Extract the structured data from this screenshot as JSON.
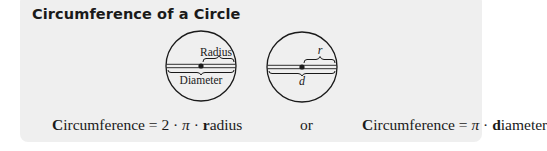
{
  "title": "Circumference of a Circle",
  "diagram_left": {
    "radius_label": "Radius",
    "diameter_label": "Diameter"
  },
  "diagram_right": {
    "radius_label": "r",
    "diameter_label": "d"
  },
  "formula_1": {
    "lhs_bold": "C",
    "lhs_rest": "ircumference",
    "equals": " = 2 · ",
    "pi": "π",
    "dot": " · ",
    "var_bold": "r",
    "var_rest": "adius"
  },
  "connector": "or",
  "formula_2": {
    "lhs_bold": "C",
    "lhs_rest": "ircumference",
    "equals": " = ",
    "pi": "π",
    "dot": " · ",
    "var_bold": "d",
    "var_rest": "iameter"
  },
  "colors": {
    "box_background": "#efefef",
    "ink": "#1a1a1a"
  }
}
